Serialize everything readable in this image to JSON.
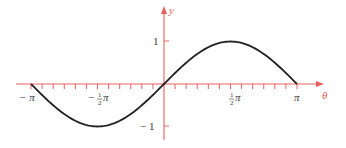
{
  "chart_data": {
    "type": "line",
    "title": "",
    "xlabel": "θ",
    "ylabel": "y",
    "function": "y = sin(θ)",
    "xlim": [
      -3.14159,
      3.14159
    ],
    "ylim": [
      -1,
      1
    ],
    "grid": false,
    "legend": null,
    "x_ticks": {
      "minor_step": "π/12",
      "labels": [
        {
          "value": -3.14159,
          "text": "−π"
        },
        {
          "value": -1.5708,
          "text": "−½π"
        },
        {
          "value": 1.5708,
          "text": "½π"
        },
        {
          "value": 3.14159,
          "text": "π"
        }
      ]
    },
    "y_ticks": {
      "labels": [
        {
          "value": 1,
          "text": "1"
        },
        {
          "value": -1,
          "text": "−1"
        }
      ]
    },
    "series": [
      {
        "name": "sin θ",
        "color": "#222222",
        "x": [
          -3.14159,
          -2.35619,
          -1.5708,
          -0.7854,
          0,
          0.7854,
          1.5708,
          2.35619,
          3.14159
        ],
        "values": [
          0,
          -0.7071,
          -1,
          -0.7071,
          0,
          0.7071,
          1,
          0.7071,
          0
        ]
      }
    ],
    "axis_color": "#e8625a",
    "axis_label_color": "#e8625a"
  },
  "labels": {
    "x_axis": "θ",
    "y_axis": "y",
    "neg_pi": "− π",
    "neg_half_pi_num": "1",
    "neg_half_pi_den": "2",
    "neg_half_pi_minus": "−",
    "neg_half_pi_pi": "π",
    "half_pi_num": "1",
    "half_pi_den": "2",
    "half_pi_pi": "π",
    "pi": "π",
    "y_one": "1",
    "y_neg_one": "− 1"
  }
}
